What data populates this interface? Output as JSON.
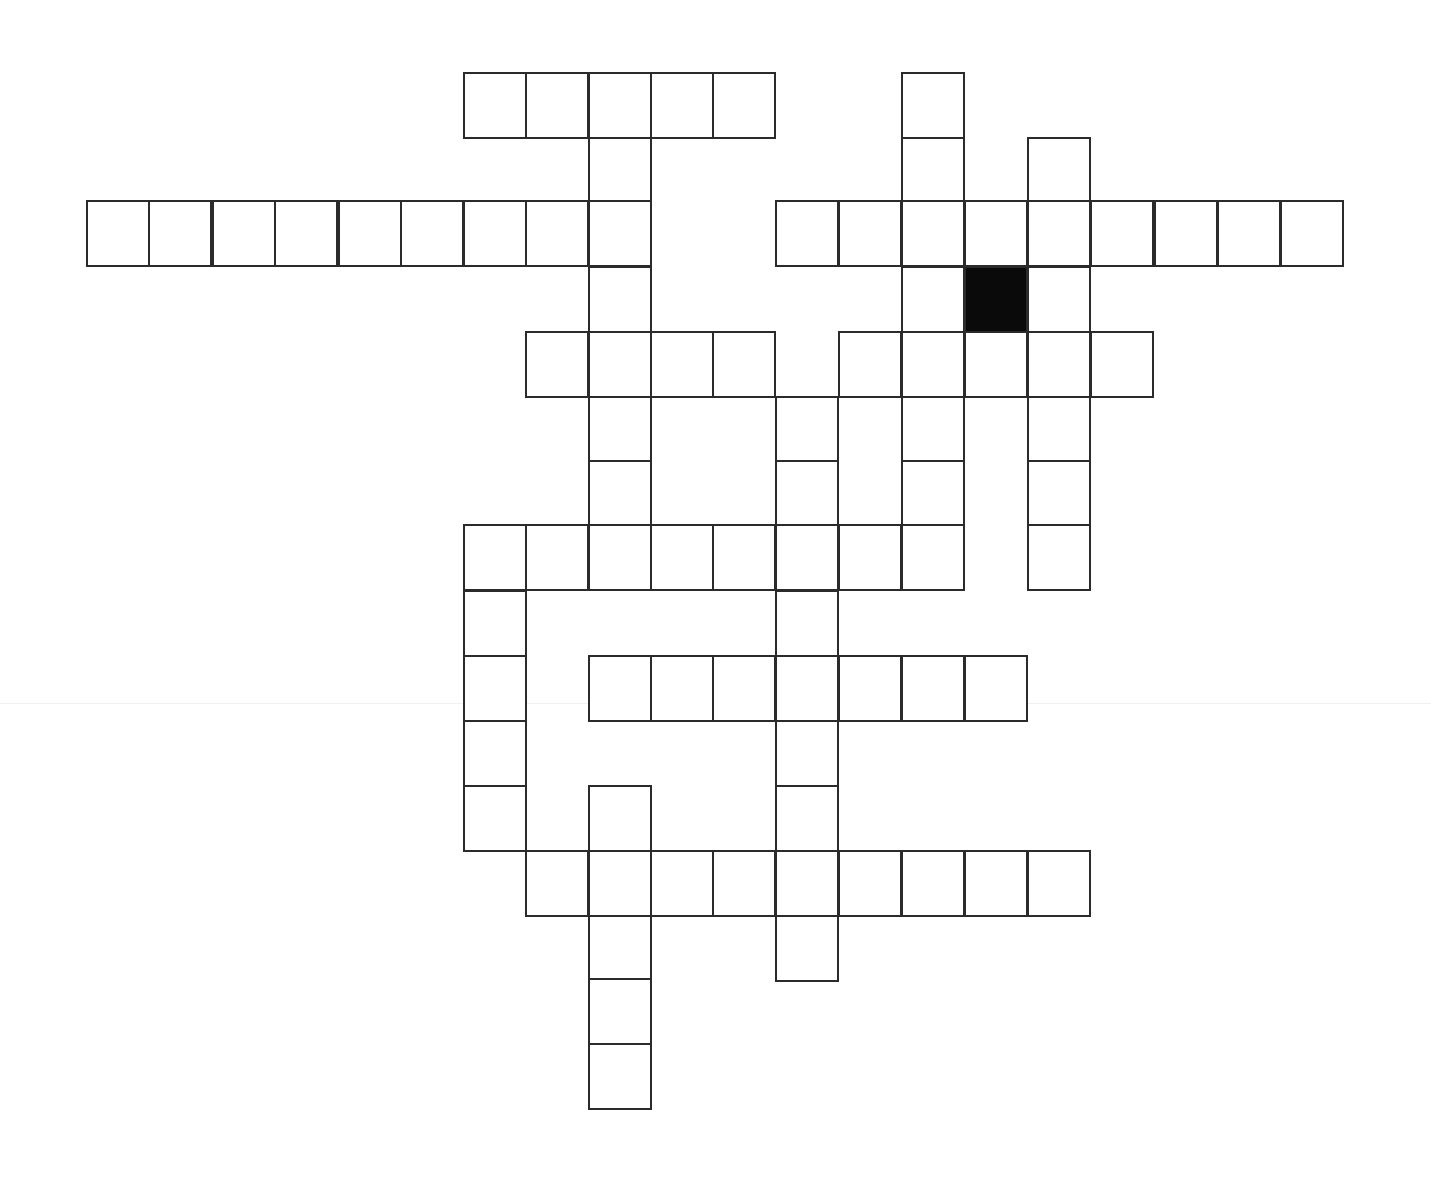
{
  "puzzle": {
    "type": "crossword",
    "colors": {
      "line": "#2b2b2b",
      "block": "#0a0a0a",
      "background": "#ffffff"
    },
    "grid": {
      "col_x": [
        86,
        148,
        212,
        274,
        338,
        400,
        463,
        525,
        588,
        650,
        712,
        775,
        838,
        901,
        964,
        1027,
        1090,
        1154,
        1217,
        1280
      ],
      "row_y": [
        72,
        137,
        200,
        266,
        331,
        396,
        460,
        524,
        590,
        655,
        720,
        785,
        850,
        915,
        978,
        1043
      ],
      "cell_w": 64,
      "cell_h": 67
    },
    "cells": [
      {
        "r": 0,
        "c": 6
      },
      {
        "r": 0,
        "c": 7
      },
      {
        "r": 0,
        "c": 8
      },
      {
        "r": 0,
        "c": 9
      },
      {
        "r": 0,
        "c": 10
      },
      {
        "r": 0,
        "c": 13
      },
      {
        "r": 1,
        "c": 8
      },
      {
        "r": 1,
        "c": 13
      },
      {
        "r": 1,
        "c": 15
      },
      {
        "r": 2,
        "c": 0
      },
      {
        "r": 2,
        "c": 1
      },
      {
        "r": 2,
        "c": 2
      },
      {
        "r": 2,
        "c": 3
      },
      {
        "r": 2,
        "c": 4
      },
      {
        "r": 2,
        "c": 5
      },
      {
        "r": 2,
        "c": 6
      },
      {
        "r": 2,
        "c": 7
      },
      {
        "r": 2,
        "c": 8
      },
      {
        "r": 2,
        "c": 11
      },
      {
        "r": 2,
        "c": 12
      },
      {
        "r": 2,
        "c": 13
      },
      {
        "r": 2,
        "c": 14
      },
      {
        "r": 2,
        "c": 15
      },
      {
        "r": 2,
        "c": 16
      },
      {
        "r": 2,
        "c": 17
      },
      {
        "r": 2,
        "c": 18
      },
      {
        "r": 2,
        "c": 19
      },
      {
        "r": 3,
        "c": 8
      },
      {
        "r": 3,
        "c": 13
      },
      {
        "r": 3,
        "c": 14,
        "block": true
      },
      {
        "r": 3,
        "c": 15
      },
      {
        "r": 4,
        "c": 7
      },
      {
        "r": 4,
        "c": 8
      },
      {
        "r": 4,
        "c": 9
      },
      {
        "r": 4,
        "c": 10
      },
      {
        "r": 4,
        "c": 12
      },
      {
        "r": 4,
        "c": 13
      },
      {
        "r": 4,
        "c": 14
      },
      {
        "r": 4,
        "c": 15
      },
      {
        "r": 4,
        "c": 16
      },
      {
        "r": 5,
        "c": 8
      },
      {
        "r": 5,
        "c": 11
      },
      {
        "r": 5,
        "c": 13
      },
      {
        "r": 5,
        "c": 15
      },
      {
        "r": 6,
        "c": 8
      },
      {
        "r": 6,
        "c": 11
      },
      {
        "r": 6,
        "c": 13
      },
      {
        "r": 6,
        "c": 15
      },
      {
        "r": 7,
        "c": 6
      },
      {
        "r": 7,
        "c": 7
      },
      {
        "r": 7,
        "c": 8
      },
      {
        "r": 7,
        "c": 9
      },
      {
        "r": 7,
        "c": 10
      },
      {
        "r": 7,
        "c": 11
      },
      {
        "r": 7,
        "c": 12
      },
      {
        "r": 7,
        "c": 13
      },
      {
        "r": 7,
        "c": 15
      },
      {
        "r": 8,
        "c": 6
      },
      {
        "r": 8,
        "c": 11
      },
      {
        "r": 9,
        "c": 6
      },
      {
        "r": 9,
        "c": 8
      },
      {
        "r": 9,
        "c": 9
      },
      {
        "r": 9,
        "c": 10
      },
      {
        "r": 9,
        "c": 11
      },
      {
        "r": 9,
        "c": 12
      },
      {
        "r": 9,
        "c": 13
      },
      {
        "r": 9,
        "c": 14
      },
      {
        "r": 10,
        "c": 6
      },
      {
        "r": 10,
        "c": 11
      },
      {
        "r": 11,
        "c": 6
      },
      {
        "r": 11,
        "c": 8
      },
      {
        "r": 11,
        "c": 11
      },
      {
        "r": 12,
        "c": 7
      },
      {
        "r": 12,
        "c": 8
      },
      {
        "r": 12,
        "c": 9
      },
      {
        "r": 12,
        "c": 10
      },
      {
        "r": 12,
        "c": 11
      },
      {
        "r": 12,
        "c": 12
      },
      {
        "r": 12,
        "c": 13
      },
      {
        "r": 12,
        "c": 14
      },
      {
        "r": 12,
        "c": 15
      },
      {
        "r": 13,
        "c": 8
      },
      {
        "r": 13,
        "c": 11
      },
      {
        "r": 14,
        "c": 8
      },
      {
        "r": 15,
        "c": 8
      }
    ]
  }
}
